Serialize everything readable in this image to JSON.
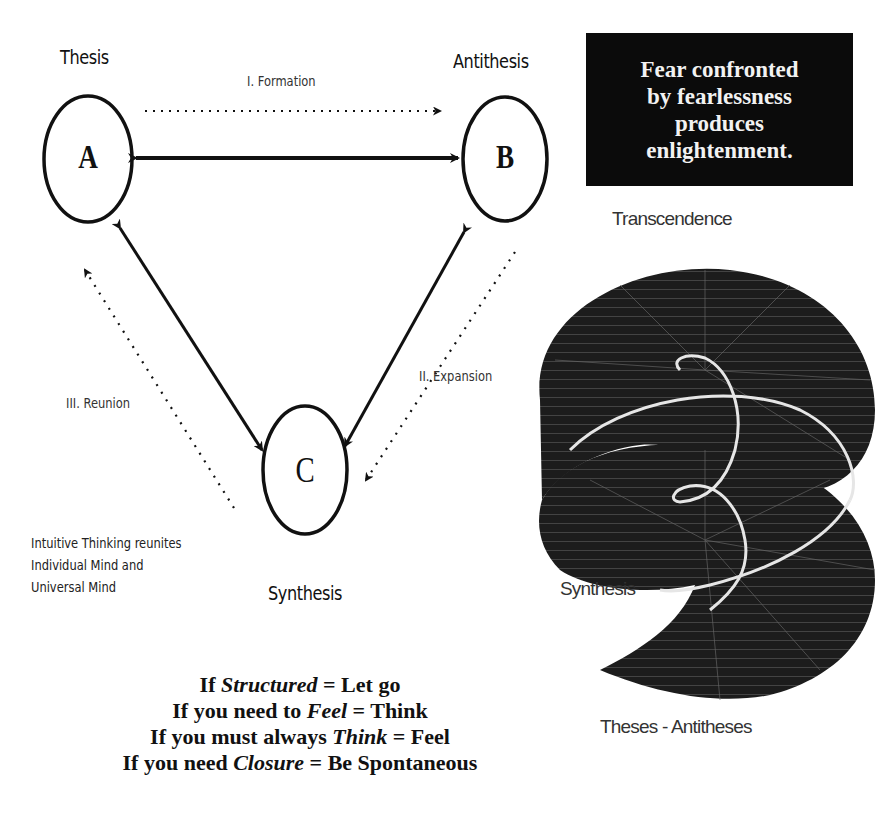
{
  "diagram": {
    "nodes": [
      {
        "id": "A",
        "letter": "A",
        "label": "Thesis"
      },
      {
        "id": "B",
        "letter": "B",
        "label": "Antithesis"
      },
      {
        "id": "C",
        "letter": "C",
        "label": "Synthesis"
      }
    ],
    "phases": {
      "formation": "I. Formation",
      "expansion": "II. Expansion",
      "reunion": "III. Reunion"
    },
    "note": {
      "line1": "Intuitive Thinking reunites",
      "line2": "Individual Mind and",
      "line3": "Universal Mind"
    }
  },
  "quote_box": {
    "line1": "Fear confronted",
    "line2": "by fearlessness",
    "line3": "produces",
    "line4": "enlightenment."
  },
  "spiral": {
    "top_label": "Transcendence",
    "middle_label": "Synthesis",
    "bottom_label": "Theses - Antitheses"
  },
  "rules": [
    {
      "prefix": "If ",
      "emphasis": "Structured",
      "suffix": " = Let go"
    },
    {
      "prefix": "If you need to ",
      "emphasis": "Feel",
      "suffix": " = Think"
    },
    {
      "prefix": "If you must always ",
      "emphasis": "Think",
      "suffix": " = Feel"
    },
    {
      "prefix": "If you need ",
      "emphasis": "Closure",
      "suffix": " = Be Spontaneous"
    }
  ],
  "colors": {
    "ink": "#111111",
    "box_bg": "#0b0b0b",
    "box_text": "#f2f2f2",
    "spiral_fill": "#1c1c1c"
  }
}
